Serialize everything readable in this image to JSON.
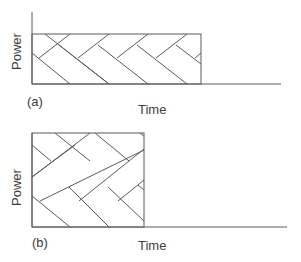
{
  "panels": [
    {
      "id": "a",
      "label": "(a)",
      "xlabel": "Time",
      "ylabel": "Power",
      "description": "Low power over long duration, herringbone-filled rectangle"
    },
    {
      "id": "b",
      "label": "(b)",
      "xlabel": "Time",
      "ylabel": "Power",
      "description": "High power over short duration, herringbone-filled rectangle"
    }
  ],
  "colors": {
    "line": "#555555",
    "axis": "#666666",
    "text": "#3c3c3c"
  }
}
